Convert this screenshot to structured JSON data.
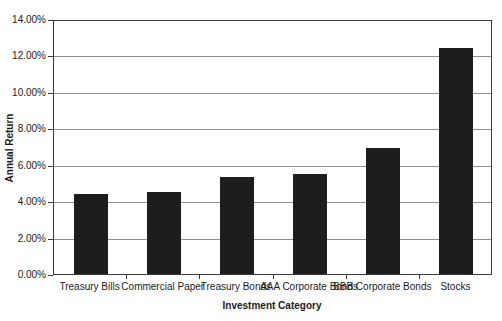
{
  "chart_data": {
    "type": "bar",
    "title": "",
    "xlabel": "Investment Category",
    "ylabel": "Annual Return",
    "categories": [
      "Treasury Bills",
      "Commercial Paper",
      "Treasury Bonds",
      "AAA Corporate Bonds",
      "BBB Corporate Bonds",
      "Stocks"
    ],
    "values": [
      4.4,
      4.5,
      5.3,
      5.5,
      6.9,
      12.4
    ],
    "ylim": [
      0,
      14
    ],
    "ytick_step": 2,
    "ytick_labels": [
      "0.00%",
      "2.00%",
      "4.00%",
      "6.00%",
      "8.00%",
      "10.00%",
      "12.00%",
      "14.00%"
    ],
    "grid": true,
    "legend_position": "none",
    "colors": {
      "bar": "#1d1d1d",
      "gridline": "#8f8f8f",
      "axis": "#3a3a3a",
      "text": "#1b1b1b",
      "background": "#ffffff"
    }
  }
}
